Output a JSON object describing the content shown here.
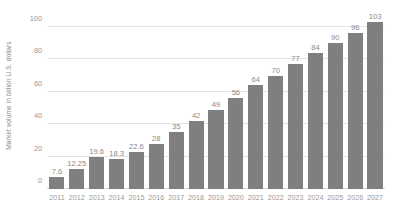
{
  "chart_data": {
    "type": "bar",
    "title": "",
    "subtitle": "",
    "xlabel": "",
    "ylabel": "Market volume in billion U.S. dollars",
    "ylim": [
      0,
      100
    ],
    "yticks": [
      0,
      20,
      40,
      60,
      80,
      100
    ],
    "ytick_labels": [
      "0",
      "20",
      "40",
      "60",
      "80",
      "100"
    ],
    "grid": true,
    "legend": false,
    "legend_position": "none",
    "orientation": "vertical",
    "bar_color": "#7f7f7f",
    "gridline_color": "#e4e4e4",
    "text_color": "#8c8c8c",
    "background_color": "#ffffff",
    "categories": [
      "2011",
      "2012",
      "2013",
      "2014",
      "2015",
      "2016",
      "2017",
      "2018",
      "2019",
      "2020",
      "2021",
      "2022",
      "2023",
      "2024",
      "2025",
      "2026",
      "2027"
    ],
    "values": [
      7.6,
      12.25,
      19.6,
      18.3,
      22.6,
      28,
      35,
      42,
      49,
      56,
      64,
      70,
      77,
      84,
      90,
      96,
      103
    ],
    "data_labels": [
      "7.6",
      "12.25",
      "19.6",
      "18.3",
      "22.6",
      "28",
      "35",
      "42",
      "49",
      "56",
      "64",
      "70",
      "77",
      "84",
      "90",
      "96",
      "103"
    ],
    "annotations": []
  }
}
